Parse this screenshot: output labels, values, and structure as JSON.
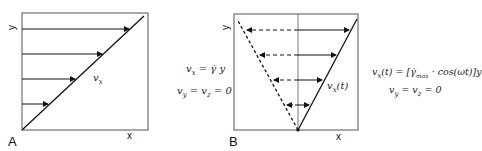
{
  "panel_a": {
    "label": "A",
    "x_axis": "x",
    "y_axis": "y",
    "profile_label": "v_x",
    "equations": [
      "v_x = γ̇ y",
      "v_y = v_z = 0"
    ]
  },
  "panel_b": {
    "label": "B",
    "x_axis": "x",
    "y_axis": "y",
    "profile_label": "v_x(t)",
    "equations": [
      "v_x(t) = [γ̇_max · cos(ωt)]y",
      "v_y = v_z = 0"
    ]
  },
  "colors": {
    "line": "#111111",
    "frame": "#444444"
  }
}
